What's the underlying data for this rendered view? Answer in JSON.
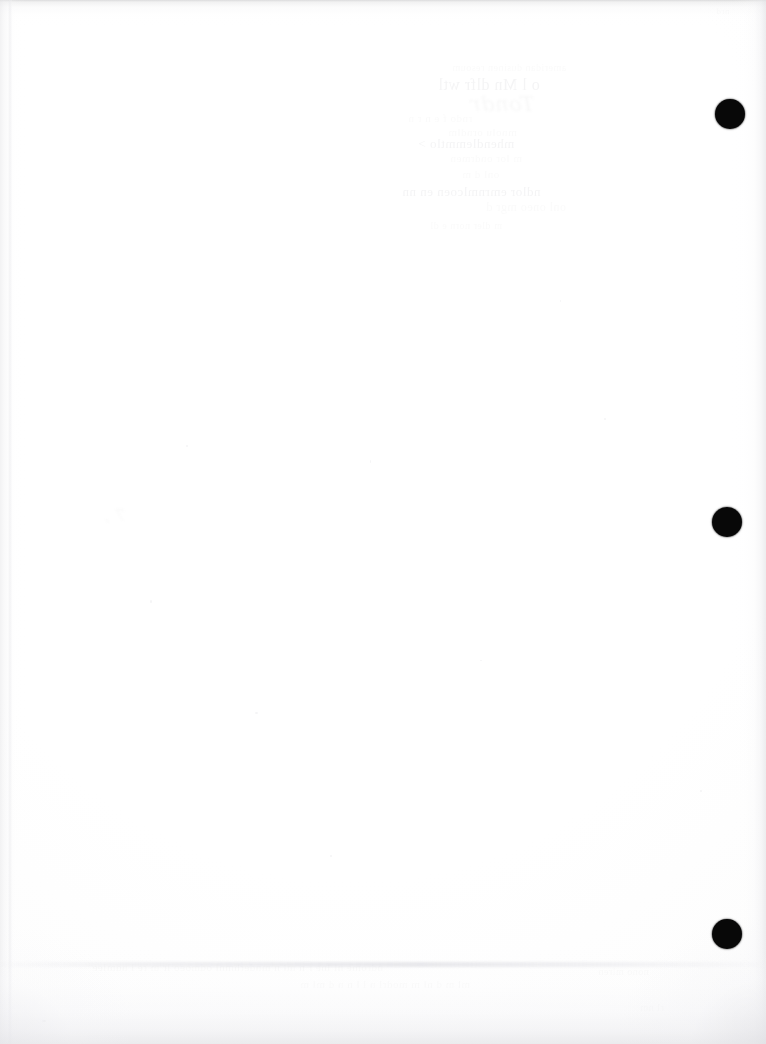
{
  "document": {
    "kind": "scanned-page",
    "title": "Scanned blank page (verso)",
    "page_width": 766,
    "page_height": 1044,
    "background_color": "#fefefe",
    "paper_tone": "#fdfdfd",
    "visible_text": "",
    "text_note": "No legible text is printed on this side of the page."
  },
  "punch_holes": {
    "name": "three-hole-punch-marks",
    "count": 3,
    "color": "#080808",
    "diameter": 30,
    "edge": "right",
    "items": [
      {
        "label": "top-punch-hole",
        "cx": 730,
        "cy": 114
      },
      {
        "label": "middle-punch-hole",
        "cx": 727,
        "cy": 522
      },
      {
        "label": "bottom-punch-hole",
        "cx": 727,
        "cy": 934
      }
    ]
  },
  "scanner_artifacts": {
    "name": "scan-edge-shading",
    "color": "#e6e6ea",
    "regions": [
      {
        "label": "top-edge-shadow",
        "position": "top",
        "thickness": 26
      },
      {
        "label": "left-edge-shadow",
        "position": "left",
        "thickness": 26
      },
      {
        "label": "right-edge-shadow",
        "position": "right",
        "thickness": 34
      },
      {
        "label": "bottom-edge-shadow",
        "position": "bottom",
        "thickness": 96
      },
      {
        "label": "bottom-grey-band",
        "position": "bottom",
        "thickness": 5
      }
    ]
  },
  "bleed_through": {
    "name": "verso-show-through",
    "note": "Extremely faint mirrored ink showing through from the reverse side; illegible.",
    "color": "#6c6c7a",
    "clusters": [
      {
        "label": "upper-block",
        "x": 430,
        "y": 62,
        "lines": 9
      },
      {
        "label": "mid-left-mark",
        "x": 100,
        "y": 508,
        "lines": 1
      },
      {
        "label": "lower-block",
        "x": 90,
        "y": 963,
        "lines": 4
      }
    ]
  }
}
